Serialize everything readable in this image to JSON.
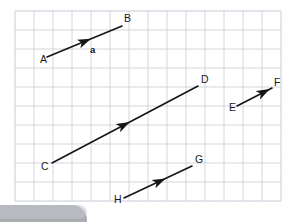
{
  "canvas": {
    "width": 306,
    "height": 222,
    "background_color": "#ffffff"
  },
  "grid": {
    "description": "graph-paper grid",
    "line_color": "#c6ccd6",
    "border_color": "#b8bfc9",
    "cell_size": 19,
    "origin_x": 15,
    "origin_y": 11,
    "cols": 14,
    "rows": 10
  },
  "diagram": {
    "title": "Parallel vectors on graph paper",
    "stroke_color": "#151515",
    "stroke_width": 1.6,
    "vectors": [
      {
        "id": "ab",
        "tail_label": "A",
        "head_label": "B",
        "name_label": "a",
        "tail_x": 47,
        "tail_y": 57,
        "head_x": 122,
        "head_y": 26,
        "arrow_t": 0.52,
        "tail_label_x": 40,
        "tail_label_y": 63,
        "head_label_x": 124,
        "head_label_y": 22,
        "name_label_x": 90,
        "name_label_y": 53
      },
      {
        "id": "cd",
        "tail_label": "C",
        "head_label": "D",
        "name_label": "",
        "tail_x": 52,
        "tail_y": 163,
        "head_x": 198,
        "head_y": 86,
        "arrow_t": 0.5,
        "tail_label_x": 41,
        "tail_label_y": 170,
        "head_label_x": 201,
        "head_label_y": 83,
        "name_label_x": 0,
        "name_label_y": 0
      },
      {
        "id": "ef",
        "tail_label": "E",
        "head_label": "F",
        "name_label": "",
        "tail_x": 237,
        "tail_y": 106,
        "head_x": 272,
        "head_y": 88,
        "arrow_t": 0.8,
        "tail_label_x": 229,
        "tail_label_y": 111,
        "head_label_x": 274,
        "head_label_y": 86,
        "name_label_x": 0,
        "name_label_y": 0
      },
      {
        "id": "hg",
        "tail_label": "H",
        "head_label": "G",
        "name_label": "",
        "tail_x": 124,
        "tail_y": 198,
        "head_x": 192,
        "head_y": 166,
        "arrow_t": 0.54,
        "tail_label_x": 114,
        "tail_label_y": 203,
        "head_label_x": 195,
        "head_label_y": 163,
        "name_label_x": 0,
        "name_label_y": 0
      }
    ]
  },
  "overlay": {
    "corner_shape_label": "grey-rounded-shape",
    "color": "#8a8e93"
  }
}
